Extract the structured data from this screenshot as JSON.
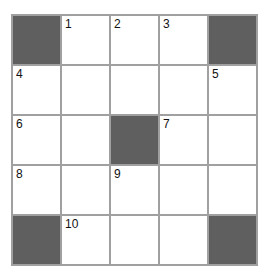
{
  "puzzle": {
    "rows": 5,
    "cols": 5,
    "colors": {
      "block": "#5f5f5f",
      "line": "#a0a0a0",
      "cell": "#ffffff"
    },
    "cells": [
      [
        {
          "block": true
        },
        {
          "num": "1"
        },
        {
          "num": "2"
        },
        {
          "num": "3"
        },
        {
          "block": true
        }
      ],
      [
        {
          "num": "4"
        },
        {},
        {},
        {},
        {
          "num": "5"
        }
      ],
      [
        {
          "num": "6"
        },
        {},
        {
          "block": true
        },
        {
          "num": "7"
        },
        {}
      ],
      [
        {
          "num": "8"
        },
        {},
        {
          "num": "9"
        },
        {},
        {}
      ],
      [
        {
          "block": true
        },
        {
          "num": "10"
        },
        {},
        {},
        {
          "block": true
        }
      ]
    ],
    "numbers": {
      "r0c1": "1",
      "r0c2": "2",
      "r0c3": "3",
      "r1c0": "4",
      "r1c4": "5",
      "r2c0": "6",
      "r2c3": "7",
      "r3c0": "8",
      "r3c2": "9",
      "r4c1": "10"
    }
  }
}
